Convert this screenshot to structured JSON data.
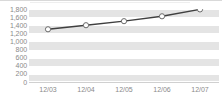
{
  "chart_data": {
    "type": "line",
    "title": "",
    "subtitle": "",
    "xlabel": "",
    "ylabel": "",
    "categories": [
      "12/03",
      "12/04",
      "12/05",
      "12/06",
      "12/07"
    ],
    "series": [
      {
        "name": "",
        "values": [
          1300,
          1400,
          1500,
          1620,
          1790
        ]
      }
    ],
    "ylim": [
      0,
      1800
    ],
    "ytick_step": 200,
    "ytick_labels": [
      "1,800",
      "1,600",
      "1,400",
      "1,200",
      "1,000",
      "800",
      "600",
      "400",
      "200",
      "0"
    ],
    "ytick_values": [
      1800,
      1600,
      1400,
      1200,
      1000,
      800,
      600,
      400,
      200,
      0
    ],
    "grid": true,
    "grid_style": "alternating-horizontal-bands",
    "legend": false,
    "legend_position": "none",
    "marker": "circle-open",
    "colors": {
      "line": "#3f3f3f",
      "marker_fill": "#ffffff",
      "marker_stroke": "#6b6b6b",
      "band": "#e4e4e4",
      "gridline": "#ffffff",
      "axis_text": "#8a8a8a",
      "plot_background": "#ffffff",
      "page_background": "#ffffff"
    }
  }
}
